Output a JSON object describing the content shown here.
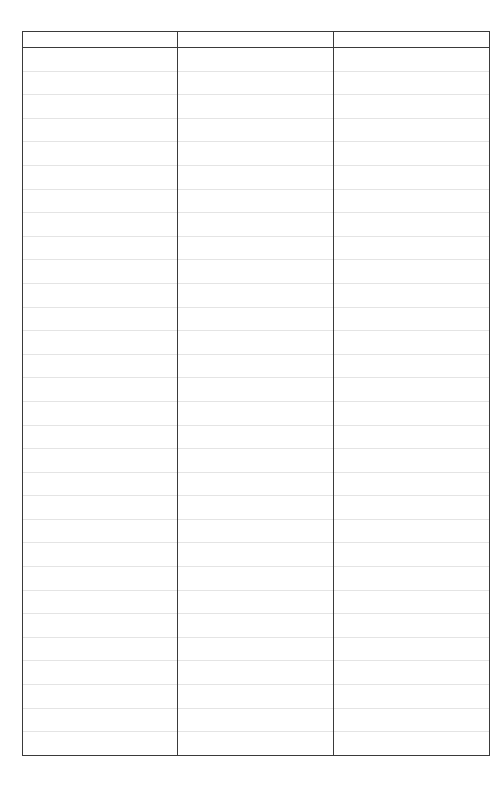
{
  "table": {
    "columns": [
      "",
      "",
      ""
    ],
    "row_count": 30,
    "rows": [
      [
        "",
        "",
        ""
      ],
      [
        "",
        "",
        ""
      ],
      [
        "",
        "",
        ""
      ],
      [
        "",
        "",
        ""
      ],
      [
        "",
        "",
        ""
      ],
      [
        "",
        "",
        ""
      ],
      [
        "",
        "",
        ""
      ],
      [
        "",
        "",
        ""
      ],
      [
        "",
        "",
        ""
      ],
      [
        "",
        "",
        ""
      ],
      [
        "",
        "",
        ""
      ],
      [
        "",
        "",
        ""
      ],
      [
        "",
        "",
        ""
      ],
      [
        "",
        "",
        ""
      ],
      [
        "",
        "",
        ""
      ],
      [
        "",
        "",
        ""
      ],
      [
        "",
        "",
        ""
      ],
      [
        "",
        "",
        ""
      ],
      [
        "",
        "",
        ""
      ],
      [
        "",
        "",
        ""
      ],
      [
        "",
        "",
        ""
      ],
      [
        "",
        "",
        ""
      ],
      [
        "",
        "",
        ""
      ],
      [
        "",
        "",
        ""
      ],
      [
        "",
        "",
        ""
      ],
      [
        "",
        "",
        ""
      ],
      [
        "",
        "",
        ""
      ],
      [
        "",
        "",
        ""
      ],
      [
        "",
        "",
        ""
      ],
      [
        "",
        "",
        ""
      ]
    ]
  },
  "colors": {
    "border": "#3a3a3a",
    "row_rule": "#e4e4e4",
    "background": "#ffffff"
  }
}
